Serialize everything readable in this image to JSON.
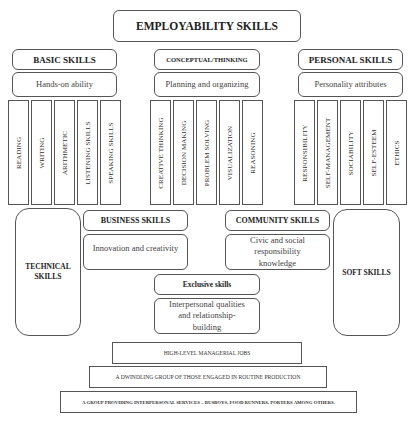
{
  "title": "EMPLOYABILITY SKILLS",
  "categories": [
    {
      "header": "BASIC SKILLS",
      "description": "Hands-on ability",
      "items": [
        "READING",
        "WRITING",
        "ARITHMETIC",
        "LISTENING SKILLS",
        "SPEAKING SKILLS"
      ]
    },
    {
      "header": "CONCEPTUAL/THINKING",
      "description": "Planning and organizing",
      "items": [
        "CREATIVE THINKING",
        "DECISION MAKING",
        "PROBLEM SOLVING",
        "VISUALIZATION",
        "REASONING"
      ]
    },
    {
      "header": "PERSONAL SKILLS",
      "description": "Personality attributes",
      "items": [
        "RESPONSIBILITY",
        "SELF-MANAGEMENT",
        "SOCIABILITY",
        "SELF-ESTEEM",
        "ETHICS"
      ]
    }
  ],
  "technical_skills": "TECHNICAL SKILLS",
  "soft_skills": "SOFT SKILLS",
  "business": {
    "header": "BUSINESS SKILLS",
    "description": "Innovation and creativity"
  },
  "community": {
    "header": "COMMUNITY SKILLS",
    "description": "Civic and social responsibility knowledge"
  },
  "exclusive": {
    "header": "Exclusive skills",
    "description": "Interpersonal qualities and relationship-building"
  },
  "tiers": [
    "HIGH-LEVEL MANAGERIAL JOBS",
    "A DWINDLING GROUP OF THOSE ENGAGED IN ROUTINE PRODUCTION",
    "A GROUP PROVIDING INTERPERSONAL SERVICES – BUSBOYS, FOOD RUNNERS, PORTERS AMONG OTHERS."
  ]
}
